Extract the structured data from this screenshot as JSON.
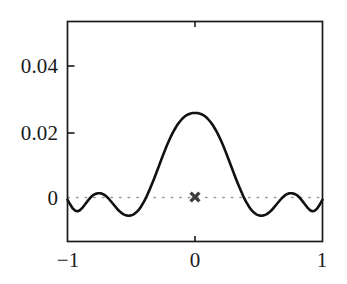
{
  "chart_data": {
    "type": "line",
    "title": "",
    "xlabel": "",
    "ylabel": "",
    "xlim": [
      -1,
      1
    ],
    "ylim": [
      -0.0123,
      0.0533
    ],
    "grid": false,
    "legend": null,
    "axis_style": "box-frame",
    "xticks": [
      -1,
      0,
      1
    ],
    "xticklabels": [
      "−1",
      "0",
      "1"
    ],
    "yticks": [
      0,
      0.02,
      0.04
    ],
    "yticklabels": [
      "0",
      "0.02",
      "0.04"
    ],
    "series": [
      {
        "name": "oscillatory-kernel",
        "style": "solid",
        "color": "#111111",
        "linewidth": 2.6,
        "x": [
          -1.0,
          -0.98,
          -0.96,
          -0.94,
          -0.92,
          -0.9,
          -0.88,
          -0.86,
          -0.84,
          -0.82,
          -0.8,
          -0.78,
          -0.76,
          -0.74,
          -0.72,
          -0.7,
          -0.68,
          -0.66,
          -0.64,
          -0.62,
          -0.6,
          -0.58,
          -0.56,
          -0.54,
          -0.52,
          -0.5,
          -0.48,
          -0.46,
          -0.44,
          -0.42,
          -0.4,
          -0.38,
          -0.36,
          -0.34,
          -0.32,
          -0.3,
          -0.28,
          -0.26,
          -0.24,
          -0.22,
          -0.2,
          -0.18,
          -0.16,
          -0.14,
          -0.12,
          -0.1,
          -0.08,
          -0.06,
          -0.04,
          -0.02,
          0.0,
          0.02,
          0.04,
          0.06,
          0.08,
          0.1,
          0.12,
          0.14,
          0.16,
          0.18,
          0.2,
          0.22,
          0.24,
          0.26,
          0.28,
          0.3,
          0.32,
          0.34,
          0.36,
          0.38,
          0.4,
          0.42,
          0.44,
          0.46,
          0.48,
          0.5,
          0.52,
          0.54,
          0.56,
          0.58,
          0.6,
          0.62,
          0.64,
          0.66,
          0.68,
          0.7,
          0.72,
          0.74,
          0.76,
          0.78,
          0.8,
          0.82,
          0.84,
          0.86,
          0.88,
          0.9,
          0.92,
          0.94,
          0.96,
          0.98,
          1.0
        ],
        "y": [
          0.0002,
          -0.0012,
          -0.0024,
          -0.0031,
          -0.0033,
          -0.0029,
          -0.0021,
          -0.0011,
          -0.0001,
          0.0008,
          0.0015,
          0.0019,
          0.0021,
          0.0021,
          0.0018,
          0.0013,
          0.0006,
          -0.0003,
          -0.0012,
          -0.0021,
          -0.003,
          -0.0037,
          -0.0042,
          -0.0045,
          -0.0046,
          -0.0045,
          -0.0042,
          -0.0036,
          -0.0028,
          -0.0017,
          -0.0004,
          0.0011,
          0.0028,
          0.0046,
          0.0065,
          0.0085,
          0.0105,
          0.0125,
          0.0145,
          0.0164,
          0.0181,
          0.0197,
          0.0211,
          0.0224,
          0.0234,
          0.0243,
          0.025,
          0.0255,
          0.0258,
          0.026,
          0.026,
          0.026,
          0.0258,
          0.0255,
          0.025,
          0.0243,
          0.0234,
          0.0224,
          0.0211,
          0.0197,
          0.0181,
          0.0164,
          0.0145,
          0.0125,
          0.0105,
          0.0085,
          0.0065,
          0.0046,
          0.0028,
          0.0011,
          -0.0004,
          -0.0017,
          -0.0028,
          -0.0036,
          -0.0042,
          -0.0045,
          -0.0046,
          -0.0045,
          -0.0042,
          -0.0037,
          -0.003,
          -0.0021,
          -0.0012,
          -0.0003,
          0.0006,
          0.0013,
          0.0018,
          0.0021,
          0.0021,
          0.0019,
          0.0015,
          0.0008,
          -0.0001,
          -0.0011,
          -0.0021,
          -0.0029,
          -0.0033,
          -0.0031,
          -0.0024,
          -0.0012,
          0.0002
        ]
      }
    ],
    "reference_lines": [
      {
        "name": "zero-line",
        "orientation": "horizontal",
        "value": 0,
        "style": "dotted",
        "color": "#9a9a9a"
      }
    ],
    "markers": [
      {
        "name": "origin-marker",
        "glyph": "x",
        "x": 0,
        "y": 0,
        "color": "#3d3d3d",
        "size": 11
      }
    ]
  },
  "labels": {
    "y": {
      "t0": "0",
      "t1": "0.02",
      "t2": "0.04"
    },
    "x": {
      "t0": "−1",
      "t1": "0",
      "t2": "1"
    }
  },
  "colors": {
    "curve": "#111111",
    "frame": "#1a1a1a",
    "zero_line": "#9a9a9a",
    "marker": "#3d3d3d",
    "background": "#ffffff",
    "text": "#1a1a1a"
  }
}
